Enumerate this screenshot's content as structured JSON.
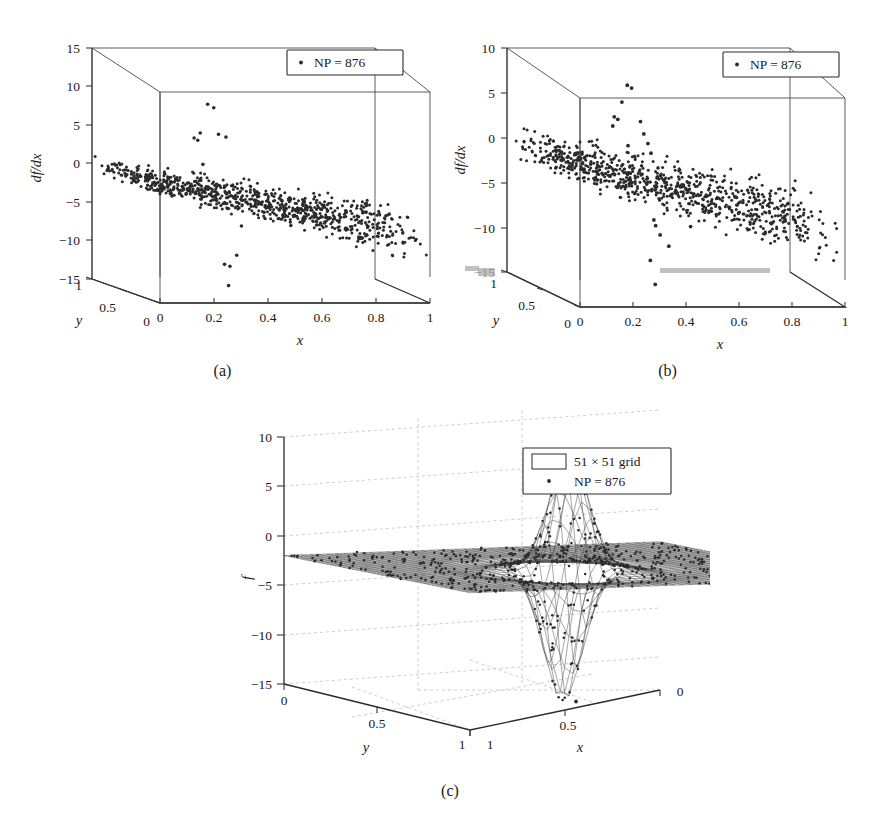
{
  "figure": {
    "panels": [
      {
        "id": "a",
        "caption": "(a)",
        "legend": [
          {
            "marker": "dot",
            "label": "NP = 876"
          }
        ]
      },
      {
        "id": "b",
        "caption": "(b)",
        "legend": [
          {
            "marker": "dot",
            "label": "NP = 876"
          }
        ]
      },
      {
        "id": "c",
        "caption": "(c)",
        "legend": [
          {
            "marker": "rect",
            "label": "51 × 51 grid"
          },
          {
            "marker": "dot",
            "label": "NP = 876"
          }
        ]
      }
    ]
  },
  "chart_data": [
    {
      "id": "a",
      "type": "scatter",
      "projection": "3d",
      "title": "",
      "xlabel": "x",
      "ylabel": "y",
      "zlabel": "df/dx",
      "xlim": [
        0,
        1
      ],
      "ylim": [
        0,
        1
      ],
      "zlim": [
        -15,
        15
      ],
      "xticks": [
        "0",
        "0.2",
        "0.4",
        "0.6",
        "0.8",
        "1"
      ],
      "xtick_values": [
        0,
        0.2,
        0.4,
        0.6,
        0.8,
        1
      ],
      "yticks": [
        "1",
        "0.5",
        "0"
      ],
      "ytick_values": [
        1,
        0.5,
        0
      ],
      "zticks": [
        "15",
        "10",
        "5",
        "0",
        "−5",
        "−10",
        "−15"
      ],
      "ztick_values": [
        15,
        10,
        5,
        0,
        -5,
        -10,
        -15
      ],
      "grid": false,
      "legend_position": "top-right",
      "n_points": 876,
      "series": [
        {
          "name": "NP = 876",
          "marker": "dot",
          "description": "Dense band of scattered derivative values sloping from about 0 at x=0 down to about -7 at x=1, band half-width about 2.5; a small cluster of positive outliers near x=0.30-0.36 reaching +5 to +9 and negative outliers near x=0.35-0.45 reaching -10 to -14.",
          "band_z_at_x0": 0,
          "band_z_at_x1": -7,
          "band_halfwidth": 2.5,
          "outliers_high": [
            {
              "x": 0.315,
              "y": 0.55,
              "z": 9.1
            },
            {
              "x": 0.325,
              "y": 0.5,
              "z": 8.8
            },
            {
              "x": 0.3,
              "y": 0.6,
              "z": 5.2
            },
            {
              "x": 0.33,
              "y": 0.45,
              "z": 5.5
            },
            {
              "x": 0.345,
              "y": 0.4,
              "z": 5.3
            },
            {
              "x": 0.29,
              "y": 0.65,
              "z": 4.4
            },
            {
              "x": 0.296,
              "y": 0.62,
              "z": 4.2
            },
            {
              "x": 0.305,
              "y": 0.58,
              "z": 1.2
            }
          ],
          "outliers_low": [
            {
              "x": 0.415,
              "y": 0.45,
              "z": -6.4
            },
            {
              "x": 0.405,
              "y": 0.48,
              "z": -10.3
            },
            {
              "x": 0.37,
              "y": 0.52,
              "z": -11.6
            },
            {
              "x": 0.385,
              "y": 0.5,
              "z": -11.8
            },
            {
              "x": 0.38,
              "y": 0.5,
              "z": -14.3
            }
          ]
        }
      ]
    },
    {
      "id": "b",
      "type": "scatter",
      "projection": "3d",
      "title": "",
      "xlabel": "x",
      "ylabel": "y",
      "zlabel": "df/dx",
      "xlim": [
        0,
        1
      ],
      "ylim": [
        0,
        1
      ],
      "zlim": [
        -15,
        10
      ],
      "xticks": [
        "0",
        "0.2",
        "0.4",
        "0.6",
        "0.8",
        "1"
      ],
      "xtick_values": [
        0,
        0.2,
        0.4,
        0.6,
        0.8,
        1
      ],
      "yticks": [
        "1",
        "0.5",
        "0"
      ],
      "ytick_values": [
        1,
        0.5,
        0
      ],
      "zticks": [
        "10",
        "5",
        "0",
        "−5",
        "−10",
        "−15"
      ],
      "ztick_values": [
        10,
        5,
        0,
        -5,
        -10,
        -15
      ],
      "ztick_note": "the −15 label is smudged in the print",
      "grid": false,
      "legend_position": "top-right",
      "n_points": 876,
      "series": [
        {
          "name": "NP = 876",
          "marker": "dot",
          "description": "Dense band of scattered derivative values sloping from about 0 at x=0 down to about -7.5 at x=1 with larger vertical spread than panel (a); a vertical string of outliers near x=0.30-0.45 spanning from +7.5 down to -13.",
          "band_z_at_x0": 0,
          "band_z_at_x1": -7.5,
          "band_halfwidth": 3.0,
          "outliers_high": [
            {
              "x": 0.33,
              "y": 0.55,
              "z": 7.6
            },
            {
              "x": 0.338,
              "y": 0.52,
              "z": 7.4
            },
            {
              "x": 0.318,
              "y": 0.58,
              "z": 5.6
            },
            {
              "x": 0.3,
              "y": 0.62,
              "z": 3.8
            },
            {
              "x": 0.308,
              "y": 0.6,
              "z": 3.6
            },
            {
              "x": 0.355,
              "y": 0.46,
              "z": 3.9
            },
            {
              "x": 0.3,
              "y": 0.64,
              "z": 2.7
            },
            {
              "x": 0.362,
              "y": 0.44,
              "z": 2.6
            },
            {
              "x": 0.372,
              "y": 0.42,
              "z": 1.6
            },
            {
              "x": 0.33,
              "y": 0.54,
              "z": 0.9
            },
            {
              "x": 0.378,
              "y": 0.4,
              "z": 0.6
            }
          ],
          "outliers_low": [
            {
              "x": 0.4,
              "y": 0.44,
              "z": -7.0
            },
            {
              "x": 0.404,
              "y": 0.43,
              "z": -7.6
            },
            {
              "x": 0.5,
              "y": 0.3,
              "z": -7.2
            },
            {
              "x": 0.418,
              "y": 0.42,
              "z": -8.6
            },
            {
              "x": 0.44,
              "y": 0.38,
              "z": -9.7
            },
            {
              "x": 0.392,
              "y": 0.46,
              "z": -11.6
            },
            {
              "x": 0.405,
              "y": 0.44,
              "z": -14.2
            }
          ]
        }
      ]
    },
    {
      "id": "c",
      "type": "surface",
      "projection": "3d",
      "title": "",
      "xlabel": "x",
      "ylabel": "y",
      "zlabel": "f",
      "xlim": [
        1,
        0
      ],
      "ylim": [
        0,
        1
      ],
      "zlim": [
        -15,
        10
      ],
      "xticks": [
        "1",
        "0.5",
        "0"
      ],
      "xtick_values": [
        1,
        0.5,
        0
      ],
      "yticks": [
        "0",
        "0.5",
        "1"
      ],
      "ytick_values": [
        0,
        0.5,
        1
      ],
      "zticks": [
        "10",
        "5",
        "0",
        "−5",
        "−10",
        "−15"
      ],
      "ztick_values": [
        10,
        5,
        0,
        -5,
        -10,
        -15
      ],
      "grid": true,
      "legend_position": "top-right",
      "grid_resolution": "51 × 51",
      "n_points": 876,
      "series": [
        {
          "name": "51 × 51 grid",
          "marker": "rect",
          "type": "mesh",
          "description": "Wireframe mesh surface that is nearly flat near f ≈ -2 over most of the domain, with a sharp positive spike rising to about +9.5 and an adjacent deep negative trough dropping to about -11.5 located near the middle-rear of the domain.",
          "peak_value": 9.5,
          "trough_value": -11.5,
          "plateau_value": -2.0
        },
        {
          "name": "NP = 876",
          "marker": "dot",
          "type": "points",
          "description": "Scattered particle samples overlaid on the mesh, clustering on the surface and tracing the spike and trough; one isolated point lies near the floor at about f = -13.6."
        }
      ]
    }
  ]
}
